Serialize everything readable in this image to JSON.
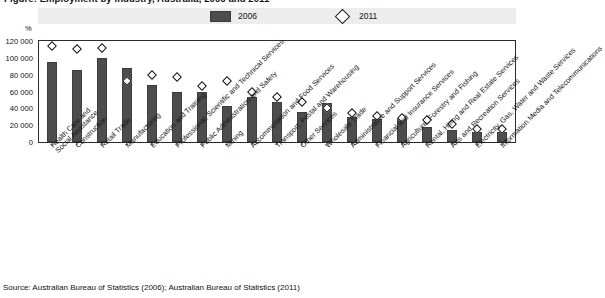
{
  "figure": {
    "title": "Figure: Employment by industry, Australia, 2006 and 2011",
    "unit_label": "%",
    "source": "Source:  Australian Bureau of Statistics (2006); Australian Bureau of Statistics (2011)"
  },
  "legend": {
    "items": [
      {
        "label": "2006",
        "marker": "filled-bar-swatch",
        "color": "#4d4d4d"
      },
      {
        "label": "2011",
        "marker": "open-diamond",
        "color": "#ffffff"
      }
    ]
  },
  "chart_data": {
    "type": "bar",
    "title": "Figure: Employment by industry, Australia, 2006 and 2011",
    "xlabel": "",
    "ylabel": "%",
    "ylim": [
      0,
      120000
    ],
    "yticks": [
      "0",
      "20 000",
      "40 000",
      "60 000",
      "80 000",
      "100 000",
      "120 000"
    ],
    "ytick_values": [
      0,
      20000,
      40000,
      60000,
      80000,
      100000,
      120000
    ],
    "grid": false,
    "legend_position": "top",
    "categories": [
      "Health Care and Social Assistance",
      "Construction",
      "Retail Trade",
      "Manufacturing",
      "Education and Training",
      "Professional, Scientific and Technical Services",
      "Public Administration and Safety",
      "Mining",
      "Accommodation and Food Services",
      "Transport, Postal and Warehousing",
      "Other Services",
      "Wholesale Trade",
      "Administrative and Support Services",
      "Financial and Insurance Services",
      "Agriculture, Forestry and Fishing",
      "Rental, Hiring and Real Estate Services",
      "Arts and Recreation Services",
      "Electricity, Gas, Water and Waste Services",
      "Information Media and Telecommunications"
    ],
    "series": [
      {
        "name": "2006",
        "marker": "bar",
        "values": [
          95000,
          86000,
          100000,
          88000,
          68000,
          60000,
          60000,
          43000,
          54000,
          48000,
          36000,
          46000,
          30000,
          27000,
          28000,
          18000,
          14000,
          12000,
          12000
        ]
      },
      {
        "name": "2011",
        "marker": "diamond",
        "values": [
          114000,
          110000,
          112000,
          73000,
          80000,
          77000,
          66000,
          73000,
          60000,
          53000,
          48000,
          40000,
          35000,
          31000,
          28000,
          26000,
          21000,
          16000,
          15000
        ]
      }
    ]
  }
}
